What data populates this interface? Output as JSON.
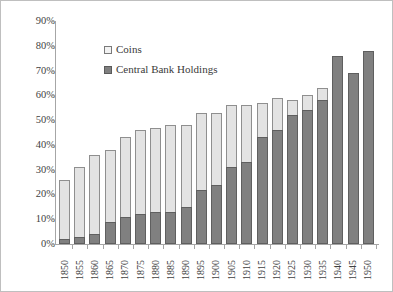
{
  "chart_data": {
    "type": "bar",
    "subtype": "stacked-bar",
    "title": "",
    "subtitle": "",
    "xlabel": "",
    "ylabel": "",
    "ylim": [
      0,
      90
    ],
    "ytick_labels": [
      "90%",
      "80%",
      "70%",
      "60%",
      "50%",
      "40%",
      "30%",
      "20%",
      "10%",
      "0%"
    ],
    "ytick_values": [
      90,
      80,
      70,
      60,
      50,
      40,
      30,
      20,
      10,
      0
    ],
    "grid": false,
    "legend_position": "upper-left-inside",
    "categories": [
      "1850",
      "1855",
      "1860",
      "1865",
      "1870",
      "1875",
      "1880",
      "1885",
      "1890",
      "1895",
      "1900",
      "1905",
      "1910",
      "1915",
      "1920",
      "1925",
      "1930",
      "1935",
      "1940",
      "1945",
      "1950"
    ],
    "series": [
      {
        "name": "Central Bank Holdings",
        "color": "#808080",
        "values": [
          2,
          3,
          4,
          9,
          11,
          12,
          13,
          13,
          15,
          22,
          24,
          31,
          33,
          43,
          46,
          52,
          54,
          58,
          76,
          69,
          78
        ]
      },
      {
        "name": "Coins",
        "color": "#e3e3e3",
        "values": [
          24,
          28,
          32,
          29,
          32,
          34,
          34,
          35,
          33,
          31,
          29,
          25,
          23,
          14,
          13,
          6,
          6,
          5,
          0,
          0,
          0
        ]
      }
    ],
    "totals": [
      26,
      31,
      36,
      38,
      43,
      46,
      47,
      48,
      48,
      53,
      53,
      56,
      56,
      57,
      59,
      58,
      60,
      63,
      76,
      69,
      78
    ]
  },
  "legend": {
    "items": [
      {
        "label": "Coins",
        "swatch": "light-square-swatch"
      },
      {
        "label": "Central Bank Holdings",
        "swatch": "dark-square-swatch"
      }
    ]
  },
  "colors": {
    "coins": "#e3e3e3",
    "central_bank_holdings": "#808080",
    "axis": "#a6a6a6",
    "text": "#3a3a3a",
    "frame": "#bfbfbf",
    "background": "#ffffff"
  }
}
